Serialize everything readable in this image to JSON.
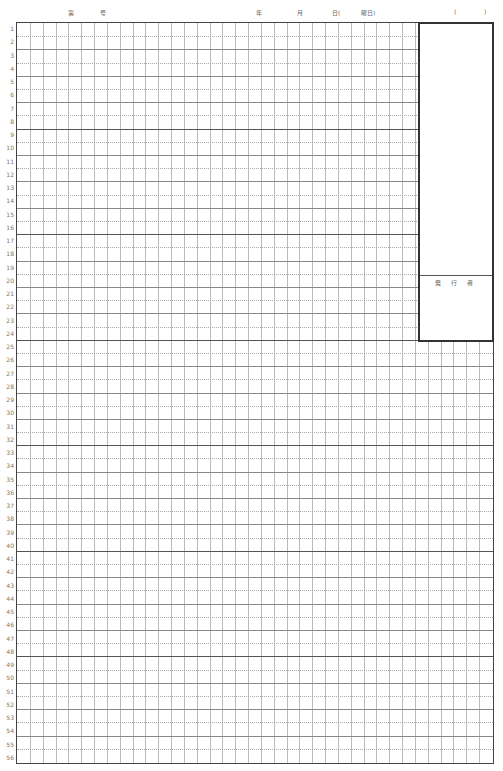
{
  "header": {
    "dai_label": "第",
    "go_label": "号",
    "year_label": "年",
    "month_label": "月",
    "day_label": "日(",
    "weekday_label": "曜日)",
    "paren_open": "(",
    "paren_close": ")"
  },
  "grid": {
    "rows": 56,
    "columns": 37,
    "major_every": 8,
    "row_numbers": [
      "1",
      "2",
      "3",
      "4",
      "5",
      "6",
      "7",
      "8",
      "9",
      "10",
      "11",
      "12",
      "13",
      "14",
      "15",
      "16",
      "17",
      "18",
      "19",
      "20",
      "21",
      "22",
      "23",
      "24",
      "25",
      "26",
      "27",
      "28",
      "29",
      "30",
      "31",
      "32",
      "33",
      "34",
      "35",
      "36",
      "37",
      "38",
      "39",
      "40",
      "41",
      "42",
      "43",
      "44",
      "45",
      "46",
      "47",
      "48",
      "49",
      "50",
      "51",
      "52",
      "53",
      "54",
      "55",
      "56"
    ]
  },
  "issuer_box": {
    "label": "発 行 者"
  }
}
